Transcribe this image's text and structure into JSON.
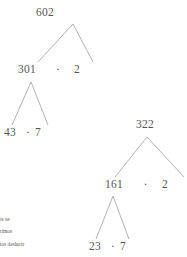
{
  "page": {
    "background_color": "#ffffff",
    "ink_color": "#555555",
    "branch_color": "#9a9a9a"
  },
  "trees": [
    {
      "name": "factor-tree-602",
      "root": "602",
      "level2": {
        "left": "301",
        "operator": "·",
        "right": "2"
      },
      "level3": {
        "left": "43",
        "operator": "·",
        "right": "7"
      }
    },
    {
      "name": "factor-tree-322",
      "root": "322",
      "level2": {
        "left": "161",
        "operator": "·",
        "right": "2"
      },
      "level3": {
        "left": "23",
        "operator": "·",
        "right": "7"
      }
    }
  ],
  "caption": {
    "lines": [
      "factores se",
      "ores primos",
      "podemos deducir"
    ]
  }
}
